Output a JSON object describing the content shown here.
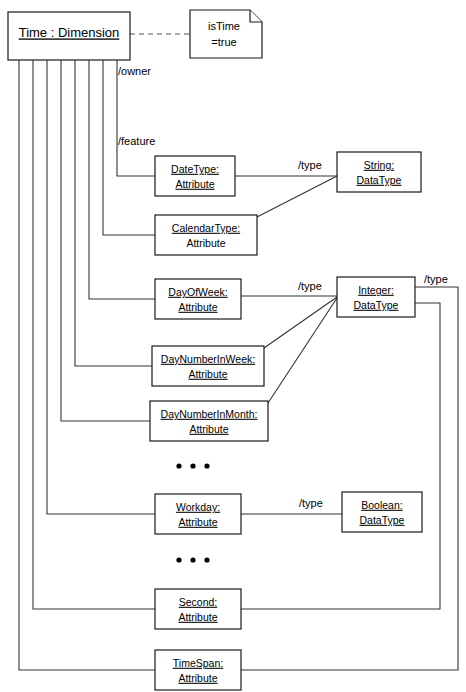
{
  "diagram": {
    "background_color": "#ffffff",
    "line_color": "#333333",
    "text_color": "#000000"
  },
  "root_node": {
    "label": "Time : Dimension",
    "x": 8,
    "y": 12,
    "w": 122,
    "h": 48
  },
  "note": {
    "line1": "isTime",
    "line2": "=true",
    "x": 190,
    "y": 10,
    "w": 72,
    "h": 48
  },
  "edge_labels": {
    "owner": "/owner",
    "feature": "/feature",
    "type_string": "/type",
    "type_integer": "/type",
    "type_integer_right": "/type",
    "type_boolean": "/type"
  },
  "attributes": [
    {
      "name": "DateType:",
      "kind": "Attribute",
      "x": 155,
      "y": 156,
      "w": 80,
      "h": 40
    },
    {
      "name": "CalendarType:",
      "kind": "Attribute",
      "x": 155,
      "y": 215,
      "w": 102,
      "h": 40
    },
    {
      "name": "DayOfWeek:",
      "kind": "Attribute",
      "x": 155,
      "y": 279,
      "w": 86,
      "h": 40
    },
    {
      "name": "DayNumberInWeek:",
      "kind": "Attribute",
      "x": 152,
      "y": 346,
      "w": 112,
      "h": 40
    },
    {
      "name": "DayNumberInMonth:",
      "kind": "Attribute",
      "x": 150,
      "y": 401,
      "w": 118,
      "h": 40
    },
    {
      "name": "Workday:",
      "kind": "Attribute",
      "x": 155,
      "y": 494,
      "w": 86,
      "h": 40
    },
    {
      "name": "Second:",
      "kind": "Attribute",
      "x": 155,
      "y": 589,
      "w": 86,
      "h": 40
    },
    {
      "name": "TimeSpan:",
      "kind": "Attribute",
      "x": 155,
      "y": 650,
      "w": 86,
      "h": 40
    }
  ],
  "datatypes": [
    {
      "name": "String:",
      "kind": "DataType",
      "x": 337,
      "y": 152,
      "w": 84,
      "h": 40
    },
    {
      "name": "Integer:",
      "kind": "DataType",
      "x": 337,
      "y": 277,
      "w": 78,
      "h": 40
    },
    {
      "name": "Boolean:",
      "kind": "DataType",
      "x": 342,
      "y": 492,
      "w": 80,
      "h": 40
    }
  ],
  "ellipses": [
    {
      "label": "...",
      "cx": 193,
      "cy": 466
    },
    {
      "label": "...",
      "cx": 193,
      "cy": 560
    }
  ]
}
